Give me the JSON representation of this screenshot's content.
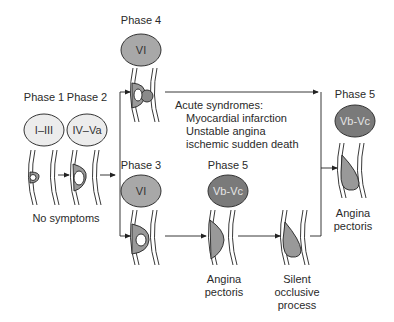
{
  "diagram": {
    "phases": {
      "phase1": {
        "label": "Phase 1",
        "stage": "I–III"
      },
      "phase2": {
        "label": "Phase 2",
        "stage": "IV–Va"
      },
      "phase3": {
        "label": "Phase 3",
        "stage": "VI"
      },
      "phase4": {
        "label": "Phase 4",
        "stage": "VI"
      },
      "phase5_middle": {
        "label": "Phase 5",
        "stage": "Vb-Vc"
      },
      "phase5_right": {
        "label": "Phase 5",
        "stage": "Vb-Vc"
      }
    },
    "captions": {
      "no_symptoms": "No symptoms",
      "acute_title": "Acute syndromes:",
      "acute_items": [
        "Myocardial infarction",
        "Unstable angina",
        "ischemic sudden death"
      ],
      "angina_middle": [
        "Angina",
        "pectoris"
      ],
      "silent": [
        "Silent",
        "occlusive",
        "process"
      ],
      "angina_right": [
        "Angina",
        "pectoris"
      ]
    },
    "colors": {
      "light_oval": "#e8e8e8",
      "mid_oval": "#a9a9a9",
      "dark_oval": "#7d7d7d",
      "plaque_fill": "#9a9a9a",
      "stroke": "#222222"
    }
  }
}
